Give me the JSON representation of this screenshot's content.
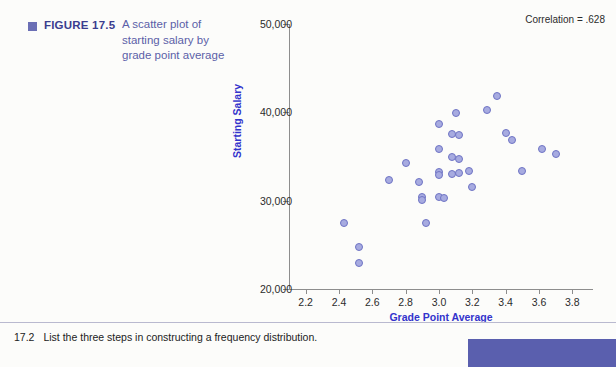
{
  "figure": {
    "bullet_icon": "square-bullet-icon",
    "label": "FIGURE 17.5",
    "caption": "A scatter plot of starting salary by grade point average"
  },
  "chart_data": {
    "type": "scatter",
    "title": "",
    "annotation": "Correlation = .628",
    "xlabel": "Grade Point Average",
    "ylabel": "Starting Salary",
    "xlim": [
      2.1,
      3.9
    ],
    "ylim": [
      20000,
      50000
    ],
    "xticks": [
      "2.2",
      "2.4",
      "2.6",
      "2.8",
      "3.0",
      "3.2",
      "3.4",
      "3.6",
      "3.8"
    ],
    "xtick_values": [
      2.2,
      2.4,
      2.6,
      2.8,
      3.0,
      3.2,
      3.4,
      3.6,
      3.8
    ],
    "yticks": [
      "20,000",
      "30,000",
      "40,000",
      "50,000"
    ],
    "ytick_values": [
      20000,
      30000,
      40000,
      50000
    ],
    "grid": false,
    "legend": "none",
    "marker_fill": "#a7abe0",
    "marker_edge": "#6f74c4",
    "points": [
      {
        "x": 2.43,
        "y": 27500
      },
      {
        "x": 2.52,
        "y": 24700
      },
      {
        "x": 2.52,
        "y": 22900
      },
      {
        "x": 2.7,
        "y": 32300
      },
      {
        "x": 2.8,
        "y": 34300
      },
      {
        "x": 2.88,
        "y": 32100
      },
      {
        "x": 2.9,
        "y": 30400
      },
      {
        "x": 2.9,
        "y": 30100
      },
      {
        "x": 2.92,
        "y": 27500
      },
      {
        "x": 3.0,
        "y": 38700
      },
      {
        "x": 3.0,
        "y": 35800
      },
      {
        "x": 3.0,
        "y": 33200
      },
      {
        "x": 3.0,
        "y": 30400
      },
      {
        "x": 3.0,
        "y": 32900
      },
      {
        "x": 3.03,
        "y": 30300
      },
      {
        "x": 3.08,
        "y": 37500
      },
      {
        "x": 3.08,
        "y": 34900
      },
      {
        "x": 3.08,
        "y": 33000
      },
      {
        "x": 3.1,
        "y": 39900
      },
      {
        "x": 3.12,
        "y": 37400
      },
      {
        "x": 3.12,
        "y": 34700
      },
      {
        "x": 3.12,
        "y": 33100
      },
      {
        "x": 3.18,
        "y": 33400
      },
      {
        "x": 3.2,
        "y": 31500
      },
      {
        "x": 3.29,
        "y": 40300
      },
      {
        "x": 3.35,
        "y": 41800
      },
      {
        "x": 3.4,
        "y": 37700
      },
      {
        "x": 3.44,
        "y": 36900
      },
      {
        "x": 3.5,
        "y": 33400
      },
      {
        "x": 3.62,
        "y": 35900
      },
      {
        "x": 3.7,
        "y": 35300
      }
    ]
  },
  "footer": {
    "number": "17.2",
    "question": "List the three steps in constructing a frequency distribution."
  }
}
